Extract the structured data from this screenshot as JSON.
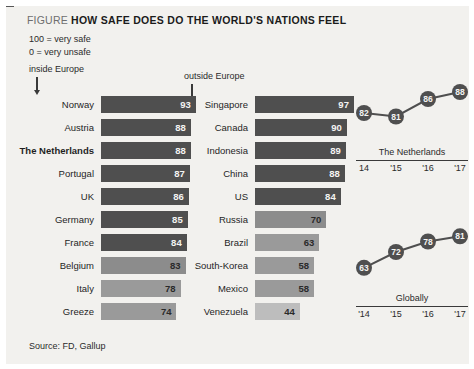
{
  "figure": {
    "kicker": "FIGURE",
    "title": "HOW SAFE DOES DO THE WORLD'S NATIONS FEEL",
    "legend_line1": "100 = very safe",
    "legend_line2": "0 = very unsafe",
    "source": "Source: FD, Gallup",
    "colors": {
      "background": "#f2f1ee",
      "bar_dark": "#4f4f4f",
      "bar_mid": "#8c8c8c",
      "bar_light": "#aeaeae",
      "bar_lightest": "#c3c3c3",
      "dot": "#4f4f4f",
      "axis": "#3a3a3a",
      "text": "#1f1f1f"
    }
  },
  "groups": {
    "inside_label": "inside Europe",
    "outside_label": "outside Europe"
  },
  "chart_data": [
    {
      "type": "bar",
      "title": "inside Europe",
      "orientation": "horizontal",
      "xlabel": "",
      "ylabel": "",
      "xlim": [
        0,
        100
      ],
      "grid": false,
      "categories": [
        "Norway",
        "Austria",
        "The Netherlands",
        "Portugal",
        "UK",
        "Germany",
        "France",
        "Belgium",
        "Italy",
        "Greeze"
      ],
      "values": [
        93,
        88,
        88,
        87,
        86,
        85,
        84,
        83,
        78,
        74
      ],
      "bar_colors": [
        "#4f4f4f",
        "#4f4f4f",
        "#4f4f4f",
        "#4f4f4f",
        "#4f4f4f",
        "#4f4f4f",
        "#4f4f4f",
        "#8c8c8c",
        "#9a9a9a",
        "#9a9a9a"
      ],
      "label_colors": [
        "on-dark",
        "on-dark",
        "on-dark",
        "on-dark",
        "on-dark",
        "on-dark",
        "on-dark",
        "on-light",
        "on-light",
        "on-light"
      ],
      "highlight": "The Netherlands"
    },
    {
      "type": "bar",
      "title": "outside Europe",
      "orientation": "horizontal",
      "xlabel": "",
      "ylabel": "",
      "xlim": [
        0,
        100
      ],
      "grid": false,
      "categories": [
        "Singapore",
        "Canada",
        "Indonesia",
        "China",
        "US",
        "Russia",
        "Brazil",
        "South-Korea",
        "Mexico",
        "Venezuela"
      ],
      "values": [
        97,
        90,
        89,
        88,
        84,
        70,
        63,
        58,
        58,
        44
      ],
      "bar_colors": [
        "#4f4f4f",
        "#4f4f4f",
        "#4f4f4f",
        "#4f4f4f",
        "#4f4f4f",
        "#8c8c8c",
        "#9a9a9a",
        "#9a9a9a",
        "#9a9a9a",
        "#bdbdbd"
      ],
      "label_colors": [
        "on-dark",
        "on-dark",
        "on-dark",
        "on-dark",
        "on-dark",
        "on-light",
        "on-light",
        "on-light",
        "on-light",
        "on-light"
      ],
      "highlight": ""
    },
    {
      "type": "line",
      "title": "The Netherlands",
      "x": [
        "14",
        "'15",
        "'16",
        "'17"
      ],
      "values": [
        82,
        81,
        86,
        88
      ],
      "xlabel": "",
      "ylabel": "",
      "ylim": [
        78,
        90
      ],
      "grid": false,
      "markers": "circle-labeled"
    },
    {
      "type": "line",
      "title": "Globally",
      "x": [
        "'14",
        "'15",
        "'16",
        "'17"
      ],
      "values": [
        63,
        72,
        78,
        81
      ],
      "xlabel": "",
      "ylabel": "",
      "ylim": [
        60,
        84
      ],
      "grid": false,
      "markers": "circle-labeled"
    }
  ]
}
